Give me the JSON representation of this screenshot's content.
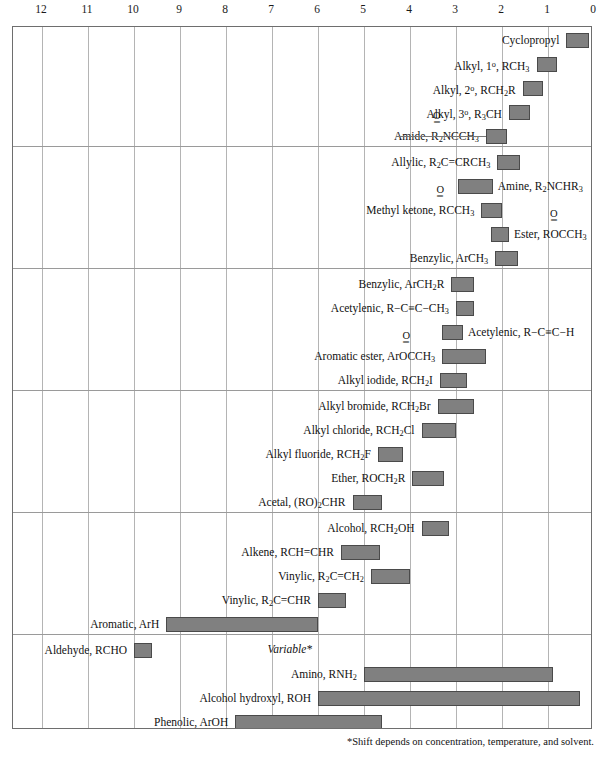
{
  "chart_data": {
    "type": "bar",
    "xlabel": "Chemical shift (ppm)",
    "ylabel": "",
    "xlim": [
      12.6,
      0
    ],
    "axis_direction": "reversed",
    "grid": true,
    "legend": "none",
    "tick_labels": [
      "12",
      "11",
      "10",
      "9",
      "8",
      "7",
      "6",
      "5",
      "4",
      "3",
      "2",
      "1",
      "0"
    ],
    "ticks": [
      12,
      11,
      10,
      9,
      8,
      7,
      6,
      5,
      4,
      3,
      2,
      1,
      0
    ],
    "bar_color": "#808080",
    "bar_border_color": "#4a4a4a",
    "grid_color": "#b4b4b4",
    "frame_color": "#6e6e6e",
    "annotations": [
      "Variable*",
      "*Shift depends on concentration, temperature, and solvent."
    ],
    "groups": [
      {
        "name": "alkyl-amide-group",
        "rows": [
          {
            "label_html": "Cyclopropyl",
            "label_text": "Cyclopropyl",
            "side": "left",
            "start": 0.6,
            "end": 0.1,
            "leader": false
          },
          {
            "label_html": "Alkyl, 1<sup>o</sup>, RCH<sub>3</sub>",
            "label_text": "Alkyl, 1°, RCH3",
            "side": "left",
            "start": 1.25,
            "end": 0.8,
            "leader": false
          },
          {
            "label_html": "Alkyl, 2<sup>o</sup>, RCH<sub>2</sub>R",
            "label_text": "Alkyl, 2°, RCH2R",
            "side": "left",
            "start": 1.55,
            "end": 1.1,
            "leader": false
          },
          {
            "label_html": "Alkyl, 3<sup>o</sup>, R<sub>3</sub>CH",
            "label_text": "Alkyl, 3°, R3CH",
            "side": "left",
            "start": 1.85,
            "end": 1.4,
            "leader": false
          },
          {
            "label_html": "Amide, R<sub>2</sub>NCCH<sub>3</sub>",
            "label_text": "Amide, R2NCCH3",
            "side": "left",
            "start": 2.35,
            "end": 1.9,
            "leader": true,
            "carbonyl_offset_em": 4.4
          }
        ]
      },
      {
        "name": "allylic-benzylic-group",
        "rows": [
          {
            "label_html": "Allylic, R<sub>2</sub>C=CRCH<sub>3</sub>",
            "label_text": "Allylic, R2C=CRCH3",
            "side": "left",
            "start": 2.1,
            "end": 1.6,
            "leader": false
          },
          {
            "label_html": "Amine, R<sub>2</sub>NCHR<sub>3</sub>",
            "label_text": "Amine, R2NCHR3",
            "side": "right",
            "start": 2.95,
            "end": 2.2,
            "leader": false
          },
          {
            "label_html": "Methyl ketone, RCCH<sub>3</sub>",
            "label_text": "Methyl ketone, RCCH3",
            "side": "left",
            "start": 2.45,
            "end": 2.0,
            "leader": false,
            "carbonyl_offset_em": 3.6
          },
          {
            "label_html": "Ester, ROCCH<sub>3</sub>",
            "label_text": "Ester, ROCCH3",
            "side": "right",
            "start": 2.25,
            "end": 1.85,
            "leader": false,
            "carbonyl_offset_em": 4.0
          },
          {
            "label_html": "Benzylic, ArCH<sub>3</sub>",
            "label_text": "Benzylic, ArCH3",
            "side": "left",
            "start": 2.15,
            "end": 1.65,
            "leader": false
          }
        ]
      },
      {
        "name": "benzylic-halide-group",
        "rows": [
          {
            "label_html": "Benzylic, ArCH<sub>2</sub>R",
            "label_text": "Benzylic, ArCH2R",
            "side": "left",
            "start": 3.1,
            "end": 2.6,
            "leader": false
          },
          {
            "label_html": "Acetylenic, R−C≡C−CH<sub>3</sub>",
            "label_text": "Acetylenic, R-C≡C-CH3",
            "side": "left",
            "start": 3.0,
            "end": 2.6,
            "leader": false
          },
          {
            "label_html": "Acetylenic, R−C≡C−H",
            "label_text": "Acetylenic, R-C≡C-H",
            "side": "right",
            "start": 3.3,
            "end": 2.85,
            "leader": false
          },
          {
            "label_html": "Aromatic ester, ArOCCH<sub>3</sub>",
            "label_text": "Aromatic ester, ArOCCH3",
            "side": "left",
            "start": 3.3,
            "end": 2.35,
            "leader": false,
            "carbonyl_offset_em": 3.1
          },
          {
            "label_html": "Alkyl iodide, RCH<sub>2</sub>I",
            "label_text": "Alkyl iodide, RCH2I",
            "side": "left",
            "start": 3.35,
            "end": 2.75,
            "leader": false
          }
        ]
      },
      {
        "name": "halide-ether-acetal-group",
        "rows": [
          {
            "label_html": "Alkyl bromide, RCH<sub>2</sub>Br",
            "label_text": "Alkyl bromide, RCH2Br",
            "side": "left",
            "start": 3.4,
            "end": 2.6,
            "leader": false
          },
          {
            "label_html": "Alkyl chloride, RCH<sub>2</sub>Cl",
            "label_text": "Alkyl chloride, RCH2Cl",
            "side": "left",
            "start": 3.75,
            "end": 3.0,
            "leader": false
          },
          {
            "label_html": "Alkyl fluoride, RCH<sub>2</sub>F",
            "label_text": "Alkyl fluoride, RCH2F",
            "side": "left",
            "start": 4.7,
            "end": 4.15,
            "leader": false
          },
          {
            "label_html": "Ether, ROCH<sub>2</sub>R",
            "label_text": "Ether, ROCH2R",
            "side": "left",
            "start": 3.95,
            "end": 3.25,
            "leader": false
          },
          {
            "label_html": "Acetal, (RO)<sub>2</sub>CHR",
            "label_text": "Acetal, (RO)2CHR",
            "side": "left",
            "start": 5.25,
            "end": 4.6,
            "leader": false
          }
        ]
      },
      {
        "name": "alcohol-alkene-vinylic-group",
        "rows": [
          {
            "label_html": "Alcohol, RCH<sub>2</sub>OH",
            "label_text": "Alcohol, RCH2OH",
            "side": "left",
            "start": 3.75,
            "end": 3.15,
            "leader": false
          },
          {
            "label_html": "Alkene, RCH=CHR",
            "label_text": "Alkene, RCH=CHR",
            "side": "left",
            "start": 5.5,
            "end": 4.65,
            "leader": false
          },
          {
            "label_html": "Vinylic, R<sub>2</sub>C=CH<sub>2</sub>",
            "label_text": "Vinylic, R2C=CH2",
            "side": "left",
            "start": 4.85,
            "end": 4.0,
            "leader": false
          },
          {
            "label_html": "Vinylic, R<sub>2</sub>C=CHR",
            "label_text": "Vinylic, R2C=CHR",
            "side": "left",
            "start": 6.0,
            "end": 5.4,
            "leader": false
          },
          {
            "label_html": "Aromatic, ArH",
            "label_text": "Aromatic, ArH",
            "side": "left",
            "start": 9.3,
            "end": 6.0,
            "leader": false
          }
        ]
      },
      {
        "name": "aldehyde-heteroatom-group",
        "rows": [
          {
            "label_html": "Aldehyde, RCHO",
            "label_text": "Aldehyde, RCHO",
            "side": "left",
            "start": 10.0,
            "end": 9.6,
            "leader": false
          },
          {
            "label_html": "Amino, RNH<sub>2</sub>",
            "label_text": "Amino, RNH2",
            "side": "left",
            "start": 5.0,
            "end": 0.9,
            "leader": false
          },
          {
            "label_html": "Alcohol hydroxyl, ROH",
            "label_text": "Alcohol hydroxyl, ROH",
            "side": "left",
            "start": 6.0,
            "end": 0.3,
            "leader": false
          },
          {
            "label_html": "Phenolic, ArOH",
            "label_text": "Phenolic, ArOH",
            "side": "left",
            "start": 7.8,
            "end": 4.6,
            "leader": false
          }
        ]
      },
      {
        "name": "carboxylic-group",
        "rows": [
          {
            "label_html": "Carboxylic, RCOOH",
            "label_text": "Carboxylic, RCOOH",
            "side": "right",
            "start": 12.6,
            "end": 9.9,
            "leader": false
          }
        ]
      }
    ]
  },
  "footnote": "*Shift depends on concentration, temperature, and solvent.",
  "variable_note": "Variable*",
  "carbonyl": {
    "o": "O",
    "bond": "‖"
  }
}
